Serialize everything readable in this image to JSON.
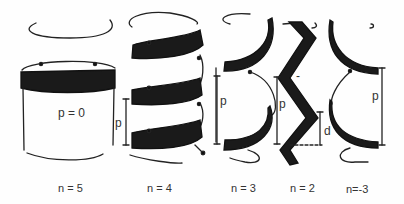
{
  "figure": {
    "panels": [
      {
        "id": "n5",
        "caption": "n = 5",
        "inner_label": "p = 0"
      },
      {
        "id": "n4",
        "caption": "n = 4",
        "pitch_label": "p"
      },
      {
        "id": "n3",
        "caption": "n = 3",
        "pitch_label": "p"
      },
      {
        "id": "n2",
        "caption": "n = 2",
        "pitch_label": "p",
        "rise_label": "d",
        "tick_label": "-"
      },
      {
        "id": "nm3",
        "caption": "n=-3",
        "pitch_label": "p"
      }
    ]
  }
}
